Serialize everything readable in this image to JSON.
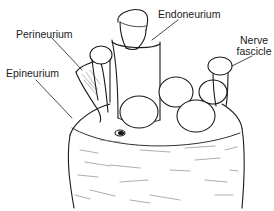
{
  "diagram": {
    "labels": [
      {
        "id": "perineurium",
        "text": "Perineurium"
      },
      {
        "id": "epineurium",
        "text": "Epineurium"
      },
      {
        "id": "endoneurium",
        "text": "Endoneurium"
      },
      {
        "id": "nerve-fascicle-line1",
        "text": "Nerve"
      },
      {
        "id": "nerve-fascicle-line2",
        "text": "fascicle"
      }
    ],
    "colors": {
      "ink": "#1a1a1a",
      "shade": "#8a8a8a",
      "background": "#ffffff"
    }
  }
}
